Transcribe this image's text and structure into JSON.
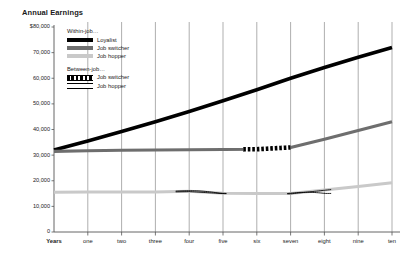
{
  "chart_data": {
    "type": "line",
    "title": "Annual Earnings",
    "xlabel": "Years",
    "ylabel": "",
    "ylim": [
      0,
      80000
    ],
    "yticks": [
      0,
      10000,
      20000,
      30000,
      40000,
      50000,
      60000,
      70000,
      80000
    ],
    "ytick_labels": [
      "0",
      "10,000",
      "20,000",
      "30,000",
      "40,000",
      "50,000",
      "60,000",
      "70,000",
      "$80,000"
    ],
    "x": [
      0,
      1,
      2,
      3,
      4,
      5,
      6,
      7,
      8,
      9,
      10
    ],
    "xtick_labels": [
      "Years",
      "one",
      "two",
      "three",
      "four",
      "five",
      "six",
      "seven",
      "eight",
      "nine",
      "ten"
    ],
    "grid": "vertical",
    "legend_position": "upper-left-inside",
    "legend_groups": [
      {
        "heading": "Within-job…",
        "entries": [
          {
            "name": "Loyalist",
            "color": "#000000",
            "style": "solid-thick"
          },
          {
            "name": "Job switcher",
            "color": "#6e6e6e",
            "style": "solid-thick"
          },
          {
            "name": "Job hopper",
            "color": "#c9c9c9",
            "style": "solid-thick"
          }
        ]
      },
      {
        "heading": "Between-job…",
        "entries": [
          {
            "name": "Job switcher",
            "color": "#000000",
            "style": "dashed-band"
          },
          {
            "name": "Job hopper",
            "color": "#000000",
            "style": "double-line"
          }
        ]
      }
    ],
    "series": [
      {
        "name": "Loyalist",
        "group": "Within-job",
        "color": "#000000",
        "values": [
          32000,
          35500,
          39200,
          43000,
          47000,
          51200,
          55500,
          60000,
          64200,
          68200,
          72000
        ]
      },
      {
        "name": "Job switcher",
        "group": "Within-job",
        "color": "#6e6e6e",
        "values": [
          31500,
          31700,
          31900,
          32000,
          32100,
          32200,
          32300,
          33000,
          36200,
          39600,
          43000
        ]
      },
      {
        "name": "Job hopper",
        "group": "Within-job",
        "color": "#c9c9c9",
        "values": [
          15500,
          15600,
          15600,
          15600,
          15900,
          15100,
          15000,
          15000,
          16400,
          17800,
          19200
        ]
      },
      {
        "name": "Job switcher (between-job)",
        "group": "Between-job",
        "color": "#000000",
        "style": "dashed-band",
        "x": [
          5.6,
          7.0
        ],
        "values": [
          32250,
          32400
        ]
      },
      {
        "name": "Job hopper (between-job) segment 1",
        "group": "Between-job",
        "color": "#000000",
        "style": "double-line",
        "x": [
          3.6,
          5.1
        ],
        "values": [
          15950,
          15050
        ]
      },
      {
        "name": "Job hopper (between-job) segment 2",
        "group": "Between-job",
        "color": "#000000",
        "style": "double-line",
        "x": [
          6.9,
          8.2
        ],
        "values": [
          15000,
          15050
        ]
      }
    ]
  }
}
